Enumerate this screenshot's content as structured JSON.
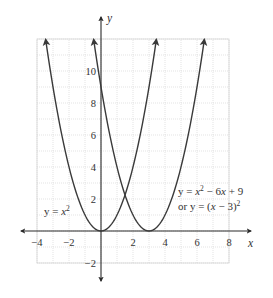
{
  "chart_data": {
    "type": "line",
    "title": "",
    "xlabel": "x",
    "ylabel": "y",
    "xlim": [
      -4,
      8
    ],
    "ylim": [
      -2,
      12
    ],
    "grid": true,
    "grid_step": 1,
    "x_ticks": [
      -4,
      -2,
      2,
      4,
      6,
      8
    ],
    "x_tick_labels": [
      "−4",
      "−2",
      "2",
      "4",
      "6",
      "8"
    ],
    "y_ticks": [
      -2,
      2,
      4,
      6,
      8,
      10
    ],
    "y_tick_labels": [
      "−2",
      "2",
      "4",
      "6",
      "8",
      "10"
    ],
    "series": [
      {
        "name": "y = x^2",
        "formula": "x^2",
        "a": 1,
        "h": 0,
        "k": 0,
        "x_range": [
          -3.46,
          3.46
        ],
        "vertex": [
          0,
          0
        ],
        "points": [
          [
            -3,
            9
          ],
          [
            -2,
            4
          ],
          [
            -1,
            1
          ],
          [
            0,
            0
          ],
          [
            1,
            1
          ],
          [
            2,
            4
          ],
          [
            3,
            9
          ]
        ]
      },
      {
        "name": "y = x^2 - 6x + 9 or y = (x - 3)^2",
        "formula": "(x-3)^2",
        "a": 1,
        "h": 3,
        "k": 0,
        "x_range": [
          -0.46,
          6.46
        ],
        "vertex": [
          3,
          0
        ],
        "points": [
          [
            0,
            9
          ],
          [
            1,
            4
          ],
          [
            2,
            1
          ],
          [
            3,
            0
          ],
          [
            4,
            1
          ],
          [
            5,
            4
          ],
          [
            6,
            9
          ]
        ]
      }
    ],
    "annotations": [
      {
        "text": "y = x²",
        "near": [
          -2.5,
          1.3
        ]
      },
      {
        "text": "y = x² − 6x + 9",
        "near": [
          4.8,
          2.6
        ]
      },
      {
        "text": "or y = (x − 3)²",
        "near": [
          4.8,
          1.5
        ]
      }
    ]
  },
  "labels": {
    "x_axis": "x",
    "y_axis": "y",
    "curve1": {
      "lhs": "y = ",
      "var": "x",
      "exp": "2"
    },
    "curve2_line1": {
      "lhs": "y = ",
      "var": "x",
      "exp": "2",
      "rest": " − 6",
      "var2": "x",
      "tail": " + 9"
    },
    "curve2_line2": {
      "pre": "or y = (",
      "var": "x",
      "mid": " − 3)",
      "exp": "2"
    }
  },
  "colors": {
    "curve": "#3a3a3a",
    "axis": "#2a2a2a",
    "grid": "#dcdcdc",
    "text": "#333333",
    "background": "#ffffff"
  }
}
